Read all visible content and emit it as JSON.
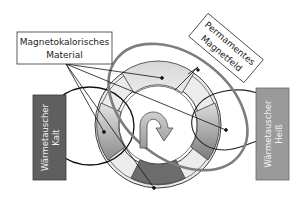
{
  "diagram": {
    "labels": {
      "magnetocaloric": {
        "line1": "Magnetokalorisches",
        "line2": "Material"
      },
      "permanent_magnet": {
        "line1": "Permamentes",
        "line2": "Magnetfeld"
      },
      "heat_exchanger_cold": {
        "line1": "Wärmetauscher",
        "line2": "Kalt"
      },
      "heat_exchanger_hot": {
        "line1": "Wärmetauscher",
        "line2": "Heiß"
      }
    },
    "icons": {
      "rotation": "curved-arrow-clockwise"
    },
    "colors": {
      "cold_box": "#5f5f5f",
      "hot_box": "#9a9a9a",
      "ring": "#e6e6e6",
      "segment_light": "#dedede",
      "segment_dark": "#6e6e6e",
      "magnet_field": "#7d7d7d",
      "line": "#1a1a1a"
    }
  }
}
